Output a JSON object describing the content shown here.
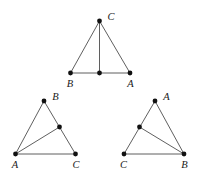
{
  "figure": {
    "background_color": "#ffffff",
    "line_color": "#4d4d4d",
    "dot_color": "#111111",
    "label_color": "#1a1a1a",
    "triangles": [
      {
        "id": "triangle-top",
        "name": "top-triangle",
        "vertices": [
          {
            "label": "C",
            "x": 99.5,
            "y": 21.0,
            "label_x": 111.0,
            "label_y": 17.5
          },
          {
            "label": "B",
            "x": 70.5,
            "y": 73.0,
            "label_x": 70.0,
            "label_y": 85.0
          },
          {
            "label": "A",
            "x": 130.0,
            "y": 73.0,
            "label_x": 130.5,
            "label_y": 85.0
          }
        ],
        "marked_point": {
          "x": 99.5,
          "y": 73.0,
          "on_side": "BA"
        },
        "cevian": {
          "from": "C",
          "to": "marked_point"
        }
      },
      {
        "id": "triangle-bottom-left",
        "name": "bottom-left-triangle",
        "vertices": [
          {
            "label": "B",
            "x": 44.0,
            "y": 101.0,
            "label_x": 55.5,
            "label_y": 97.5
          },
          {
            "label": "A",
            "x": 15.5,
            "y": 154.0,
            "label_x": 15.0,
            "label_y": 166.0
          },
          {
            "label": "C",
            "x": 75.5,
            "y": 154.0,
            "label_x": 76.0,
            "label_y": 166.0
          }
        ],
        "marked_point": {
          "x": 59.5,
          "y": 127.0,
          "on_side": "BC"
        },
        "cevian": {
          "from": "A",
          "to": "marked_point"
        }
      },
      {
        "id": "triangle-bottom-right",
        "name": "bottom-right-triangle",
        "vertices": [
          {
            "label": "A",
            "x": 155.0,
            "y": 101.0,
            "label_x": 166.5,
            "label_y": 97.5
          },
          {
            "label": "C",
            "x": 124.0,
            "y": 154.0,
            "label_x": 123.5,
            "label_y": 166.0
          },
          {
            "label": "B",
            "x": 184.0,
            "y": 154.0,
            "label_x": 184.5,
            "label_y": 166.0
          }
        ],
        "marked_point": {
          "x": 139.5,
          "y": 127.0,
          "on_side": "AC"
        },
        "cevian": {
          "from": "B",
          "to": "marked_point"
        }
      }
    ]
  }
}
